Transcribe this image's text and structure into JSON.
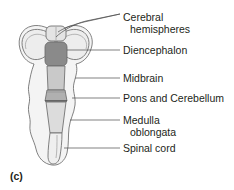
{
  "figure": {
    "panel_label": "(c)",
    "type": "anatomical-diagram",
    "background_color": "#ffffff",
    "text_color": "#231f20",
    "leader_line_color": "#4a4a4a",
    "outline_color": "#6b6b6b"
  },
  "labels": [
    {
      "id": "cerebral-hemispheres",
      "line1": "Cerebral",
      "line2": "hemispheres",
      "text_x": 123,
      "text_y": 17,
      "line_x_end": 120,
      "line_y": 14,
      "branch": true
    },
    {
      "id": "diencephalon",
      "line1": "Diencephalon",
      "line2": "",
      "text_x": 123,
      "text_y": 53,
      "line_x_end": 120,
      "line_y": 50,
      "branch": false
    },
    {
      "id": "midbrain",
      "line1": "Midbrain",
      "line2": "",
      "text_x": 123,
      "text_y": 81,
      "line_x_end": 120,
      "line_y": 78,
      "branch": false
    },
    {
      "id": "pons-and-cerebellum",
      "line1": "Pons and Cerebellum",
      "line2": "",
      "text_x": 123,
      "text_y": 101,
      "line_x_end": 120,
      "line_y": 98,
      "branch": false
    },
    {
      "id": "medulla-oblongata",
      "line1": "Medulla",
      "line2": "oblongata",
      "text_x": 123,
      "text_y": 123,
      "line_x_end": 120,
      "line_y": 120,
      "branch": false
    },
    {
      "id": "spinal-cord",
      "line1": "Spinal cord",
      "line2": "",
      "text_x": 123,
      "text_y": 151,
      "line_x_end": 120,
      "line_y": 148,
      "branch": false
    }
  ],
  "anatomy": {
    "regions": [
      {
        "id": "cerebral-hemisphere-left",
        "fill": "#ededed"
      },
      {
        "id": "cerebral-hemisphere-right",
        "fill": "#ededed"
      },
      {
        "id": "olfactory-bulbs",
        "fill": "#e4e4e4"
      },
      {
        "id": "diencephalon",
        "fill": "#8a8a8a"
      },
      {
        "id": "midbrain",
        "fill": "#c9c9c9"
      },
      {
        "id": "pons-and-cerebellum",
        "fill": "#b0b0b0"
      },
      {
        "id": "medulla-oblongata",
        "fill": "#dcdcdc"
      },
      {
        "id": "spinal-cord",
        "fill": "#efefef"
      },
      {
        "id": "meninges-outline",
        "fill": "#f4f4f4"
      }
    ]
  }
}
